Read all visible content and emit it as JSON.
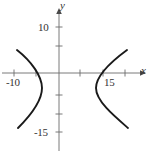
{
  "figure": {
    "kind": "hyperbola-graph",
    "width": 150,
    "height": 153,
    "background": "#ffffff",
    "curve_color": "#1a1a1a",
    "axis_color": "#666666",
    "text_color": "#333333"
  },
  "axes": {
    "x_label": "x",
    "y_label": "y",
    "origin_px": {
      "x": 59,
      "y": 73
    },
    "x_axis_y_px": 73,
    "y_axis_x_px": 59,
    "x_tick_labels": [
      {
        "text": "-10",
        "value": -10,
        "x_px": 14
      },
      {
        "text": "15",
        "value": 15,
        "x_px": 105
      }
    ],
    "y_tick_labels": [
      {
        "text": "10",
        "value": 10,
        "y_px": 27
      },
      {
        "text": "-15",
        "value": -15,
        "y_px": 132
      }
    ],
    "x_ticks_px": [
      14,
      36,
      80,
      103,
      125
    ],
    "y_ticks_px": [
      27,
      46,
      95,
      114,
      132
    ],
    "grid": false
  },
  "chart_data": {
    "type": "line",
    "title": "",
    "xlabel": "x",
    "ylabel": "y",
    "xlim": [
      -18,
      22
    ],
    "ylim": [
      -18,
      13
    ],
    "grid": false,
    "legend": "none",
    "series": [
      {
        "name": "left-branch",
        "values_px": "M17,50 C31,61 42,76 42,88 C42,101 30,116 18,128"
      },
      {
        "name": "right-branch",
        "values_px": "M127,50 C112,61 96,76 96,88 C96,101 114,116 128,128"
      }
    ]
  },
  "labels": {
    "x_neg_ten": "-10",
    "x_fifteen": "15",
    "y_ten": "10",
    "y_neg_fifteen": "-15",
    "axis_x": "x",
    "axis_y": "y"
  }
}
